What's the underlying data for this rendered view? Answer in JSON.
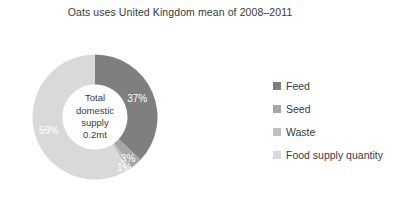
{
  "chart_data": {
    "type": "pie",
    "variant": "donut",
    "title": "Oats uses United Kingdom mean of 2008–2011",
    "xlabel": "",
    "ylabel": "",
    "grid": false,
    "legend_position": "right",
    "start_angle_deg": 0,
    "direction": "clockwise",
    "categories": [
      "Feed",
      "Seed",
      "Waste",
      "Food supply quantity"
    ],
    "values": [
      37,
      3,
      1,
      59
    ],
    "value_unit": "%",
    "data_labels": [
      "37%",
      "3%",
      "1%",
      "59%"
    ],
    "colors": [
      "#7f7f7f",
      "#a6a6a6",
      "#bfbfbf",
      "#d9d9d9"
    ],
    "center_annotation": [
      "Total",
      "domestic",
      "supply",
      "0.2mt"
    ],
    "annotations": [
      "Total domestic supply 0.2mt"
    ],
    "slices": [
      {
        "label": "Feed",
        "value": 37,
        "display": "37%",
        "color": "#7f7f7f"
      },
      {
        "label": "Seed",
        "value": 3,
        "display": "3%",
        "color": "#a6a6a6"
      },
      {
        "label": "Waste",
        "value": 1,
        "display": "1%",
        "color": "#bfbfbf"
      },
      {
        "label": "Food supply quantity",
        "value": 59,
        "display": "59%",
        "color": "#d9d9d9"
      }
    ]
  },
  "title": {
    "text": "Oats uses United Kingdom mean of 2008–2011"
  },
  "center": {
    "line1": "Total",
    "line2": "domestic",
    "line3": "supply",
    "line4": "0.2mt"
  },
  "labels": {
    "feed": "37%",
    "seed": "3%",
    "waste": "1%",
    "food": "59%"
  },
  "legend": {
    "items": [
      {
        "label": "Feed",
        "color": "#7f7f7f"
      },
      {
        "label": "Seed",
        "color": "#a6a6a6"
      },
      {
        "label": "Waste",
        "color": "#bfbfbf"
      },
      {
        "label": "Food supply quantity",
        "color": "#d9d9d9"
      }
    ]
  }
}
